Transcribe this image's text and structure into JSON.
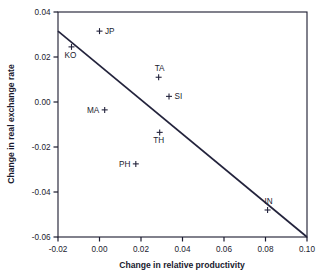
{
  "chart_data": {
    "type": "scatter",
    "title": "",
    "xlabel": "Change in relative productivity",
    "ylabel": "Change in real exchange rate",
    "xlim": [
      -0.02,
      0.1
    ],
    "ylim": [
      -0.06,
      0.04
    ],
    "xticks": [
      "-0.02",
      "0.00",
      "0.02",
      "0.04",
      "0.06",
      "0.08",
      "0.10"
    ],
    "xtick_values": [
      -0.02,
      0.0,
      0.02,
      0.04,
      0.06,
      0.08,
      0.1
    ],
    "yticks": [
      "0.04",
      "0.02",
      "0.00",
      "-0.02",
      "-0.04",
      "-0.06"
    ],
    "ytick_values": [
      0.04,
      0.02,
      0.0,
      -0.02,
      -0.04,
      -0.06
    ],
    "grid": false,
    "legend": "none",
    "marker_symbol": "+",
    "points": [
      {
        "label": "JP",
        "x": 0.0,
        "y": 0.0315,
        "label_pos": "right"
      },
      {
        "label": "KO",
        "x": -0.0135,
        "y": 0.0245,
        "label_pos": "below"
      },
      {
        "label": "TA",
        "x": 0.0285,
        "y": 0.011,
        "label_pos": "above"
      },
      {
        "label": "SI",
        "x": 0.0335,
        "y": 0.0025,
        "label_pos": "right"
      },
      {
        "label": "MA",
        "x": 0.0025,
        "y": -0.0035,
        "label_pos": "left"
      },
      {
        "label": "TH",
        "x": 0.029,
        "y": -0.0135,
        "label_pos": "below"
      },
      {
        "label": "PH",
        "x": 0.0175,
        "y": -0.0275,
        "label_pos": "left"
      },
      {
        "label": "IN",
        "x": 0.081,
        "y": -0.048,
        "label_pos": "above"
      }
    ],
    "trendline": {
      "name": "fitted-regression-line",
      "x_start": -0.02,
      "y_start": 0.0315,
      "x_end": 0.1,
      "y_end": -0.06
    }
  }
}
